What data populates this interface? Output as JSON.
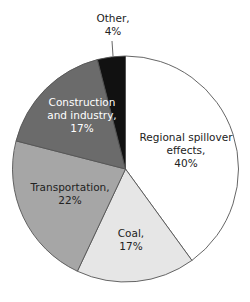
{
  "chart_data": {
    "type": "pie",
    "title": "",
    "start_angle_deg": 0,
    "direction": "clockwise",
    "slices": [
      {
        "label": "Regional spillover effects",
        "value": 40,
        "color": "#ffffff"
      },
      {
        "label": "Coal",
        "value": 17,
        "color": "#e6e6e6"
      },
      {
        "label": "Transportation",
        "value": 22,
        "color": "#a6a6a6"
      },
      {
        "label": "Construction and industry",
        "value": 17,
        "color": "#6b6b6b"
      },
      {
        "label": "Other",
        "value": 4,
        "color": "#111111"
      }
    ]
  },
  "labels": {
    "regional": {
      "line1": "Regional spillover",
      "line2": "effects,",
      "line3": "40%"
    },
    "coal": {
      "line1": "Coal,",
      "line2": "17%"
    },
    "transport": {
      "line1": "Transportation,",
      "line2": "22%"
    },
    "construction": {
      "line1": "Construction",
      "line2": "and industry,",
      "line3": "17%"
    },
    "other": {
      "line1": "Other,",
      "line2": "4%"
    }
  }
}
